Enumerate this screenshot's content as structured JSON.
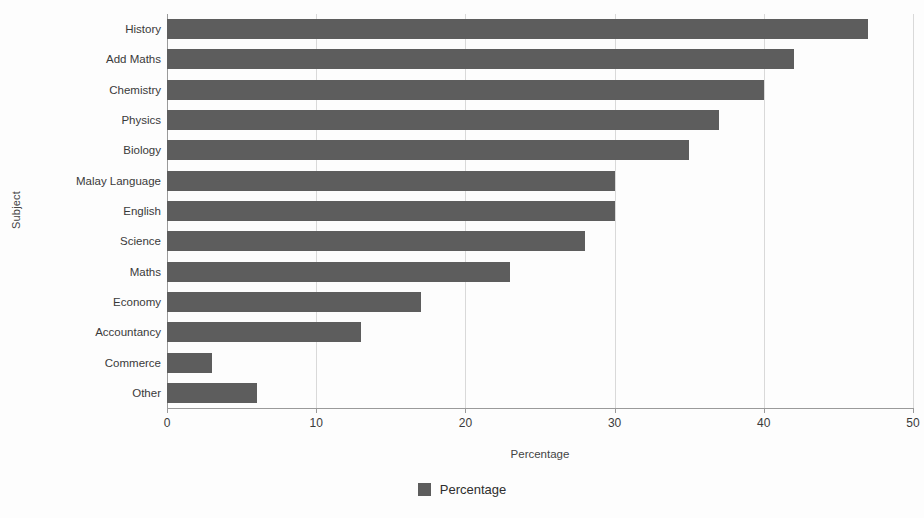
{
  "chart_data": {
    "type": "bar",
    "orientation": "horizontal",
    "title": "",
    "xlabel": "Percentage",
    "ylabel": "Subject",
    "xlim": [
      0,
      50
    ],
    "xticks": [
      0,
      10,
      20,
      30,
      40,
      50
    ],
    "xtick_labels": [
      "0",
      "10",
      "20",
      "30",
      "40",
      "50"
    ],
    "grid": true,
    "grid_axis": "x",
    "legend": {
      "position": "bottom-center",
      "entries": [
        {
          "name": "Percentage",
          "color": "#5d5d5d"
        }
      ]
    },
    "categories": [
      "History",
      "Add Maths",
      "Chemistry",
      "Physics",
      "Biology",
      "Malay Language",
      "English",
      "Science",
      "Maths",
      "Economy",
      "Accountancy",
      "Commerce",
      "Other"
    ],
    "series": [
      {
        "name": "Percentage",
        "color": "#5d5d5d",
        "values": [
          47,
          42,
          40,
          37,
          35,
          30,
          30,
          28,
          23,
          17,
          13,
          3,
          6
        ]
      }
    ]
  },
  "colors": {
    "bar": "#5d5d5d",
    "gridline": "#d9d9d9",
    "axis": "#9a9a9a",
    "background": "#fdfdfd",
    "text": "#3a3a3a"
  }
}
